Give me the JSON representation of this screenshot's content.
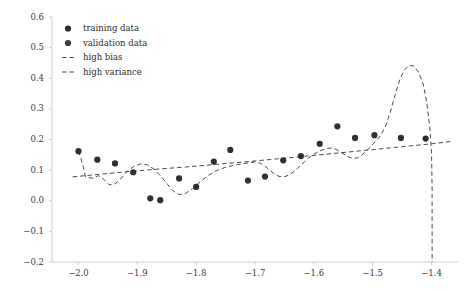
{
  "chart_data": {
    "type": "scatter",
    "title": "",
    "xlabel": "",
    "ylabel": "",
    "xlim": [
      -2.045,
      -1.355
    ],
    "ylim": [
      -0.2,
      0.6
    ],
    "grid": false,
    "legend_position": "upper left",
    "xticks": [
      -2.0,
      -1.9,
      -1.8,
      -1.7,
      -1.6,
      -1.5,
      -1.4
    ],
    "xtick_labels": [
      "−2.0",
      "−1.9",
      "−1.8",
      "−1.7",
      "−1.6",
      "−1.5",
      "−1.4"
    ],
    "yticks": [
      -0.2,
      -0.1,
      0.0,
      0.1,
      0.2,
      0.3,
      0.4,
      0.5,
      0.6
    ],
    "ytick_labels": [
      "−0.2",
      "−0.1",
      "0.0",
      "0.1",
      "0.2",
      "0.3",
      "0.4",
      "0.5",
      "0.6"
    ],
    "legend": [
      {
        "label": "training data",
        "marker": "circle",
        "color": "#2f2f2f"
      },
      {
        "label": "validation data",
        "marker": "circle",
        "color": "#3c3c3c"
      },
      {
        "label": "high bias",
        "marker": "dashed-line",
        "color": "#4a4a4a"
      },
      {
        "label": "high variance",
        "marker": "dashed-line",
        "color": "#4a4a4a"
      }
    ],
    "series": [
      {
        "name": "training data",
        "type": "scatter",
        "marker": "circle",
        "color": "#2f2f2f",
        "points": [
          [
            -2.0,
            0.162
          ],
          [
            -1.968,
            0.134
          ],
          [
            -1.938,
            0.122
          ],
          [
            -1.907,
            0.093
          ],
          [
            -1.878,
            0.008
          ],
          [
            -1.861,
            0.002
          ],
          [
            -1.829,
            0.073
          ],
          [
            -1.8,
            0.045
          ],
          [
            -1.77,
            0.128
          ],
          [
            -1.742,
            0.166
          ],
          [
            -1.712,
            0.066
          ],
          [
            -1.683,
            0.079
          ],
          [
            -1.652,
            0.132
          ],
          [
            -1.622,
            0.146
          ],
          [
            -1.59,
            0.186
          ],
          [
            -1.56,
            0.243
          ],
          [
            -1.53,
            0.205
          ],
          [
            -1.497,
            0.214
          ],
          [
            -1.452,
            0.205
          ],
          [
            -1.41,
            0.203
          ]
        ]
      },
      {
        "name": "high bias",
        "type": "line",
        "linestyle": "dashed",
        "color": "#4a4a4a",
        "points": [
          [
            -2.01,
            0.078
          ],
          [
            -1.9,
            0.098
          ],
          [
            -1.8,
            0.113
          ],
          [
            -1.7,
            0.13
          ],
          [
            -1.6,
            0.148
          ],
          [
            -1.5,
            0.167
          ],
          [
            -1.4,
            0.186
          ],
          [
            -1.368,
            0.193
          ]
        ]
      },
      {
        "name": "high variance",
        "type": "line",
        "linestyle": "dashed",
        "color": "#4a4a4a",
        "points": [
          [
            -2.0,
            0.162
          ],
          [
            -1.993,
            0.12
          ],
          [
            -1.988,
            0.078
          ],
          [
            -1.975,
            0.073
          ],
          [
            -1.966,
            0.082
          ],
          [
            -1.957,
            0.07
          ],
          [
            -1.948,
            0.052
          ],
          [
            -1.938,
            0.055
          ],
          [
            -1.928,
            0.072
          ],
          [
            -1.918,
            0.095
          ],
          [
            -1.906,
            0.112
          ],
          [
            -1.895,
            0.12
          ],
          [
            -1.884,
            0.118
          ],
          [
            -1.872,
            0.104
          ],
          [
            -1.86,
            0.08
          ],
          [
            -1.848,
            0.052
          ],
          [
            -1.838,
            0.03
          ],
          [
            -1.828,
            0.02
          ],
          [
            -1.818,
            0.024
          ],
          [
            -1.806,
            0.04
          ],
          [
            -1.793,
            0.062
          ],
          [
            -1.78,
            0.082
          ],
          [
            -1.766,
            0.098
          ],
          [
            -1.752,
            0.108
          ],
          [
            -1.738,
            0.115
          ],
          [
            -1.724,
            0.12
          ],
          [
            -1.71,
            0.124
          ],
          [
            -1.7,
            0.127
          ],
          [
            -1.69,
            0.122
          ],
          [
            -1.68,
            0.108
          ],
          [
            -1.67,
            0.092
          ],
          [
            -1.66,
            0.08
          ],
          [
            -1.65,
            0.078
          ],
          [
            -1.64,
            0.086
          ],
          [
            -1.63,
            0.102
          ],
          [
            -1.62,
            0.12
          ],
          [
            -1.61,
            0.138
          ],
          [
            -1.6,
            0.152
          ],
          [
            -1.59,
            0.163
          ],
          [
            -1.58,
            0.17
          ],
          [
            -1.572,
            0.172
          ],
          [
            -1.562,
            0.168
          ],
          [
            -1.552,
            0.156
          ],
          [
            -1.542,
            0.144
          ],
          [
            -1.534,
            0.138
          ],
          [
            -1.526,
            0.14
          ],
          [
            -1.518,
            0.15
          ],
          [
            -1.51,
            0.164
          ],
          [
            -1.502,
            0.18
          ],
          [
            -1.494,
            0.196
          ],
          [
            -1.486,
            0.214
          ],
          [
            -1.478,
            0.244
          ],
          [
            -1.47,
            0.29
          ],
          [
            -1.462,
            0.345
          ],
          [
            -1.454,
            0.395
          ],
          [
            -1.446,
            0.428
          ],
          [
            -1.438,
            0.442
          ],
          [
            -1.43,
            0.44
          ],
          [
            -1.422,
            0.42
          ],
          [
            -1.414,
            0.38
          ],
          [
            -1.408,
            0.32
          ],
          [
            -1.403,
            0.24
          ],
          [
            -1.4,
            0.16
          ],
          [
            -1.399,
            0.04
          ],
          [
            -1.399,
            -0.1
          ],
          [
            -1.399,
            -0.2
          ]
        ]
      }
    ]
  }
}
